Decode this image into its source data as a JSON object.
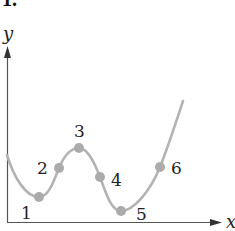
{
  "header": {
    "label": "1."
  },
  "axes": {
    "x_label": "x",
    "y_label": "y"
  },
  "colors": {
    "curve": "#b3b3b3",
    "point": "#ababab",
    "axis": "#555555",
    "text": "#222222"
  },
  "points": [
    {
      "label": "1",
      "x": 39,
      "y": 197,
      "lx": 27,
      "ly": 219
    },
    {
      "label": "2",
      "x": 59,
      "y": 168,
      "lx": 43,
      "ly": 174
    },
    {
      "label": "3",
      "x": 79,
      "y": 148,
      "lx": 79,
      "ly": 136
    },
    {
      "label": "4",
      "x": 100,
      "y": 177,
      "lx": 117,
      "ly": 186
    },
    {
      "label": "5",
      "x": 121,
      "y": 211,
      "lx": 141,
      "ly": 219
    },
    {
      "label": "6",
      "x": 160,
      "y": 167,
      "lx": 177,
      "ly": 174
    }
  ]
}
